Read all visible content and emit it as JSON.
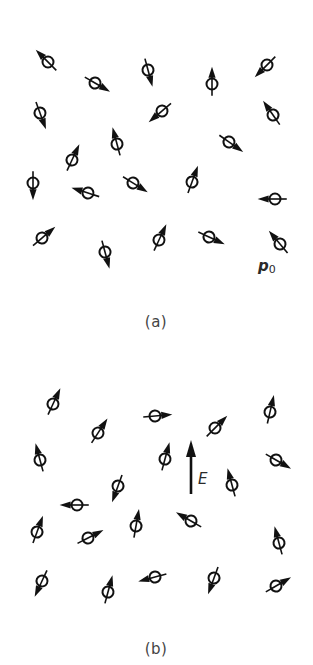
{
  "figure": {
    "stroke_color": "#111111",
    "background": "#ffffff",
    "dipole_length": 28,
    "circle_radius": 5.5
  },
  "panel_a": {
    "caption": "(a)",
    "dipole_label": {
      "main": "p",
      "sub": "0"
    },
    "dipoles": [
      {
        "x": 48,
        "y": 62,
        "angle": 135
      },
      {
        "x": 95,
        "y": 83,
        "angle": -30
      },
      {
        "x": 148,
        "y": 70,
        "angle": -75
      },
      {
        "x": 212,
        "y": 84,
        "angle": 90
      },
      {
        "x": 267,
        "y": 65,
        "angle": -135
      },
      {
        "x": 40,
        "y": 113,
        "angle": -70
      },
      {
        "x": 162,
        "y": 111,
        "angle": -140
      },
      {
        "x": 273,
        "y": 115,
        "angle": 125
      },
      {
        "x": 72,
        "y": 160,
        "angle": 65
      },
      {
        "x": 117,
        "y": 144,
        "angle": 105
      },
      {
        "x": 229,
        "y": 142,
        "angle": -35
      },
      {
        "x": 33,
        "y": 183,
        "angle": -90
      },
      {
        "x": 88,
        "y": 193,
        "angle": 162
      },
      {
        "x": 133,
        "y": 183,
        "angle": -32
      },
      {
        "x": 192,
        "y": 182,
        "angle": 70
      },
      {
        "x": 275,
        "y": 199,
        "angle": 180
      },
      {
        "x": 42,
        "y": 238,
        "angle": 40
      },
      {
        "x": 105,
        "y": 252,
        "angle": -75
      },
      {
        "x": 159,
        "y": 240,
        "angle": 65
      },
      {
        "x": 209,
        "y": 237,
        "angle": -25
      },
      {
        "x": 280,
        "y": 244,
        "angle": 130
      }
    ]
  },
  "panel_b": {
    "caption": "(b)",
    "field_label": "E",
    "field_arrow": {
      "x": 191,
      "y_tail": 494,
      "y_head": 440
    },
    "dipoles": [
      {
        "x": 53,
        "y": 404,
        "angle": 65
      },
      {
        "x": 98,
        "y": 433,
        "angle": 57
      },
      {
        "x": 155,
        "y": 416,
        "angle": 5
      },
      {
        "x": 270,
        "y": 412,
        "angle": 77
      },
      {
        "x": 215,
        "y": 428,
        "angle": 45
      },
      {
        "x": 40,
        "y": 460,
        "angle": 105
      },
      {
        "x": 165,
        "y": 459,
        "angle": 75
      },
      {
        "x": 276,
        "y": 460,
        "angle": -30
      },
      {
        "x": 232,
        "y": 485,
        "angle": 105
      },
      {
        "x": 118,
        "y": 486,
        "angle": -110
      },
      {
        "x": 77,
        "y": 505,
        "angle": 180
      },
      {
        "x": 37,
        "y": 532,
        "angle": 70
      },
      {
        "x": 88,
        "y": 538,
        "angle": 27
      },
      {
        "x": 136,
        "y": 526,
        "angle": 80
      },
      {
        "x": 191,
        "y": 521,
        "angle": 150
      },
      {
        "x": 279,
        "y": 543,
        "angle": 105
      },
      {
        "x": 42,
        "y": 581,
        "angle": -115
      },
      {
        "x": 108,
        "y": 592,
        "angle": 75
      },
      {
        "x": 155,
        "y": 577,
        "angle": -165
      },
      {
        "x": 214,
        "y": 578,
        "angle": -110
      },
      {
        "x": 276,
        "y": 586,
        "angle": 30
      }
    ]
  }
}
